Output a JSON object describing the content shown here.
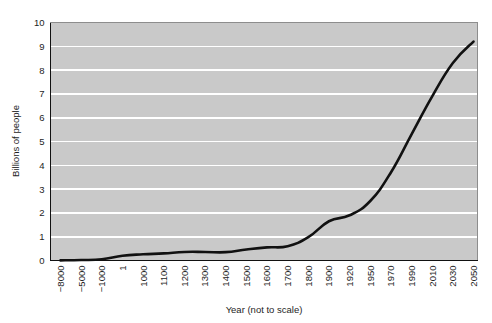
{
  "chart_data": {
    "type": "line",
    "title": "",
    "subtitle": "",
    "xlabel": "Year (not to scale)",
    "ylabel": "Billions of people",
    "xlim_note": "categorical / not to scale",
    "ylim": [
      0,
      10
    ],
    "grid": "horizontal gridlines at every 1 billion, white on gray plot background",
    "legend": "none",
    "x_tick_labels": [
      "−8000",
      "−5000",
      "−1000",
      "1",
      "1000",
      "1100",
      "1200",
      "1300",
      "1400",
      "1500",
      "1600",
      "1700",
      "1800",
      "1900",
      "1920",
      "1950",
      "1970",
      "1990",
      "2010",
      "2030",
      "2050"
    ],
    "y_tick_labels": [
      "0",
      "1",
      "2",
      "3",
      "4",
      "5",
      "6",
      "7",
      "8",
      "9",
      "10"
    ],
    "categories": [
      "-8000",
      "-5000",
      "-1000",
      "1",
      "1000",
      "1100",
      "1200",
      "1300",
      "1400",
      "1500",
      "1600",
      "1700",
      "1800",
      "1900",
      "1920",
      "1950",
      "1970",
      "1990",
      "2010",
      "2030",
      "2050"
    ],
    "values": [
      0.005,
      0.02,
      0.05,
      0.2,
      0.26,
      0.3,
      0.36,
      0.36,
      0.35,
      0.46,
      0.55,
      0.6,
      0.98,
      1.65,
      1.9,
      2.5,
      3.7,
      5.3,
      6.9,
      8.3,
      9.2
    ],
    "series": [
      {
        "name": "World population",
        "values": [
          0.005,
          0.02,
          0.05,
          0.2,
          0.26,
          0.3,
          0.36,
          0.36,
          0.35,
          0.46,
          0.55,
          0.6,
          0.98,
          1.65,
          1.9,
          2.5,
          3.7,
          5.3,
          6.9,
          8.3,
          9.2
        ],
        "color": "#111111"
      }
    ],
    "colors": {
      "line": "#111111",
      "plot_background": "#c9c9c9",
      "gridline": "#ffffff",
      "page_background": "#ffffff",
      "frame": "#8d8d8d",
      "text": "#1e1e1e"
    }
  }
}
